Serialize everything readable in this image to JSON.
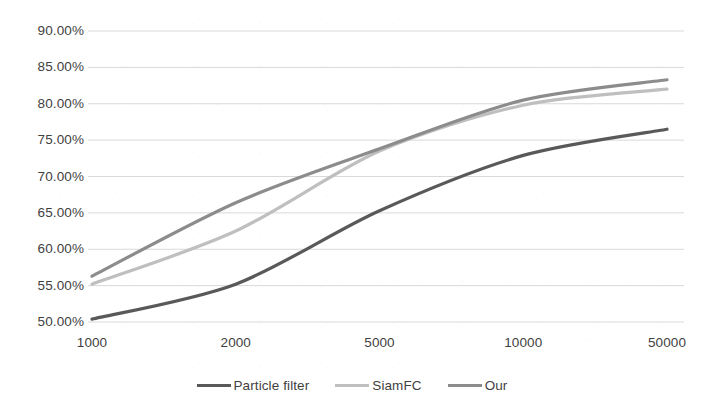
{
  "chart_data": {
    "type": "line",
    "title": "",
    "subtitle": "",
    "xlabel": "",
    "ylabel": "",
    "categories": [
      "1000",
      "2000",
      "5000",
      "10000",
      "50000"
    ],
    "ylim": [
      50,
      90
    ],
    "ytick_values": [
      90,
      85,
      80,
      75,
      70,
      65,
      60,
      55,
      50
    ],
    "ytick_labels": [
      "90.00%",
      "85.00%",
      "80.00%",
      "75.00%",
      "70.00%",
      "65.00%",
      "60.00%",
      "55.00%",
      "50.00%"
    ],
    "grid": "horizontal",
    "legend_position": "bottom-center",
    "series": [
      {
        "name": "Particle filter",
        "color": "#595959",
        "values": [
          50.4,
          55.2,
          65.3,
          72.9,
          76.5
        ]
      },
      {
        "name": "SiamFC",
        "color": "#bfbfbf",
        "values": [
          55.2,
          62.5,
          73.5,
          79.8,
          82.0
        ]
      },
      {
        "name": "Our",
        "color": "#8c8c8c",
        "values": [
          56.3,
          66.4,
          73.8,
          80.5,
          83.3
        ]
      }
    ]
  },
  "axes": {
    "y_labels": [
      {
        "text": "90.00%"
      },
      {
        "text": "85.00%"
      },
      {
        "text": "80.00%"
      },
      {
        "text": "75.00%"
      },
      {
        "text": "70.00%"
      },
      {
        "text": "65.00%"
      },
      {
        "text": "60.00%"
      },
      {
        "text": "55.00%"
      },
      {
        "text": "50.00%"
      }
    ],
    "x_labels": [
      {
        "text": "1000"
      },
      {
        "text": "2000"
      },
      {
        "text": "5000"
      },
      {
        "text": "10000"
      },
      {
        "text": "50000"
      }
    ]
  },
  "legend": {
    "items": [
      {
        "label": "Particle filter",
        "color": "#595959"
      },
      {
        "label": "SiamFC",
        "color": "#bfbfbf"
      },
      {
        "label": "Our",
        "color": "#8c8c8c"
      }
    ]
  },
  "colors": {
    "gridline": "#d9d9d9",
    "text": "#3f3f3f",
    "background": "#ffffff",
    "series_particle_filter": "#595959",
    "series_siamfc": "#bfbfbf",
    "series_our": "#8c8c8c"
  }
}
